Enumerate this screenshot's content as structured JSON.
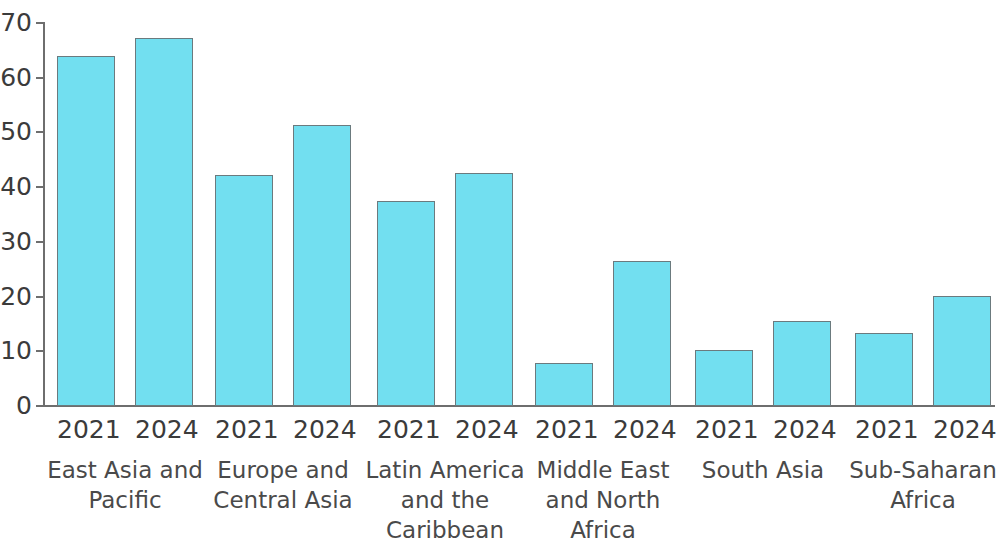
{
  "chart_data": {
    "type": "bar",
    "title": "",
    "subtitle": "",
    "xlabel": "",
    "ylabel": "",
    "ylim": [
      0,
      70
    ],
    "yticks": [
      0,
      10,
      20,
      30,
      40,
      50,
      60,
      70
    ],
    "ytick_labels": [
      "0",
      "10",
      "20",
      "30",
      "40",
      "50",
      "60",
      "70"
    ],
    "grid": false,
    "legend": "none",
    "bar_color": "#72DFF0",
    "bar_edge_color": "#6b7a7e",
    "axis_color": "#6e6e6e",
    "text_color": "#3b3b3b",
    "categories": [
      "East Asia and Pacific",
      "Europe and Central Asia",
      "Latin America and the Caribbean",
      "Middle East and North Africa",
      "South Asia",
      "Sub-Saharan Africa"
    ],
    "sub_categories": [
      "2021",
      "2024"
    ],
    "series": [
      {
        "name": "2021",
        "values": [
          63.9,
          42.3,
          37.4,
          7.8,
          10.2,
          13.4
        ]
      },
      {
        "name": "2024",
        "values": [
          67.2,
          51.4,
          42.6,
          26.5,
          15.6,
          20.1
        ]
      }
    ],
    "bars": [
      {
        "group": "East Asia and Pacific",
        "year": "2021",
        "value": 63.9
      },
      {
        "group": "East Asia and Pacific",
        "year": "2024",
        "value": 67.2
      },
      {
        "group": "Europe and Central Asia",
        "year": "2021",
        "value": 42.3
      },
      {
        "group": "Europe and Central Asia",
        "year": "2024",
        "value": 51.4
      },
      {
        "group": "Latin America and the Caribbean",
        "year": "2021",
        "value": 37.4
      },
      {
        "group": "Latin America and the Caribbean",
        "year": "2024",
        "value": 42.6
      },
      {
        "group": "Middle East and North Africa",
        "year": "2021",
        "value": 7.8
      },
      {
        "group": "Middle East and North Africa",
        "year": "2024",
        "value": 26.5
      },
      {
        "group": "South Asia",
        "year": "2021",
        "value": 10.2
      },
      {
        "group": "South Asia",
        "year": "2024",
        "value": 15.6
      },
      {
        "group": "Sub-Saharan Africa",
        "year": "2021",
        "value": 13.4
      },
      {
        "group": "Sub-Saharan Africa",
        "year": "2024",
        "value": 20.1
      }
    ],
    "group_label_lines": [
      [
        "East Asia and",
        "Pacific"
      ],
      [
        "Europe and",
        "Central Asia"
      ],
      [
        "Latin America",
        "and the",
        "Caribbean"
      ],
      [
        "Middle East",
        "and North",
        "Africa"
      ],
      [
        "South Asia"
      ],
      [
        "Sub-Saharan",
        "Africa"
      ]
    ]
  }
}
